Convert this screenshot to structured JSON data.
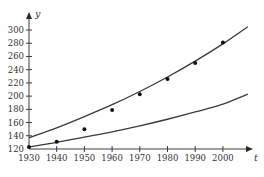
{
  "chart_data": {
    "type": "scatter",
    "title": "",
    "xlabel": "t",
    "ylabel": "y",
    "xlim": [
      1930,
      2012
    ],
    "ylim": [
      120,
      315
    ],
    "grid": false,
    "legend": null,
    "x_ticks": [
      1930,
      1940,
      1950,
      1960,
      1970,
      1980,
      1990,
      2000
    ],
    "y_ticks": [
      120,
      140,
      160,
      180,
      200,
      220,
      240,
      260,
      280,
      300
    ],
    "series": [
      {
        "name": "data points",
        "type": "scatter",
        "x": [
          1930,
          1940,
          1950,
          1960,
          1970,
          1980,
          1990,
          2000
        ],
        "values": [
          123,
          131,
          150,
          179,
          203,
          226,
          250,
          281
        ]
      },
      {
        "name": "upper curve",
        "type": "line",
        "x": [
          1930,
          1940,
          1950,
          1960,
          1970,
          1980,
          1990,
          2000,
          2009
        ],
        "values": [
          137,
          152,
          169,
          187,
          207,
          229,
          253,
          279,
          305
        ]
      },
      {
        "name": "lower curve",
        "type": "line",
        "x": [
          1930,
          1940,
          1950,
          1960,
          1970,
          1980,
          1990,
          2000,
          2009
        ],
        "values": [
          123,
          130,
          138,
          146,
          155,
          165,
          176,
          188,
          203
        ]
      }
    ]
  }
}
